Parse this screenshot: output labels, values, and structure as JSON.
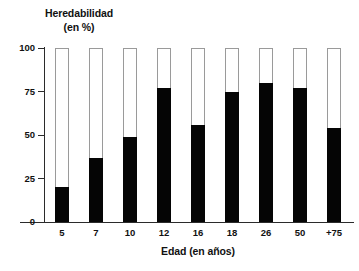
{
  "chart_data": {
    "type": "bar",
    "title": "",
    "categories": [
      "5",
      "7",
      "10",
      "12",
      "16",
      "18",
      "26",
      "50",
      "+75"
    ],
    "values": [
      20,
      37,
      49,
      77,
      56,
      75,
      80,
      77,
      54
    ],
    "series": [
      {
        "name": "Heredabilidad",
        "values": [
          20,
          37,
          49,
          77,
          56,
          75,
          80,
          77,
          54
        ]
      }
    ],
    "ylabel": "Heredabilidad (en %)",
    "ylabel_line1": "Heredabilidad",
    "ylabel_line2": "(en %)",
    "xlabel": "Edad (en años)",
    "ylim": [
      0,
      100
    ],
    "yticks": [
      "0",
      "25",
      "50",
      "75",
      "100"
    ],
    "ytick_values": [
      0,
      25,
      50,
      75,
      100
    ],
    "grid": false,
    "legend": "none",
    "bar_fill_color": "#050505",
    "bar_outline_color": "#9a9a9a",
    "bar_track_color": "#ffffff",
    "axis_color": "#2b2b2b",
    "background_color": "#ffffff",
    "bar_total_height": 100
  }
}
